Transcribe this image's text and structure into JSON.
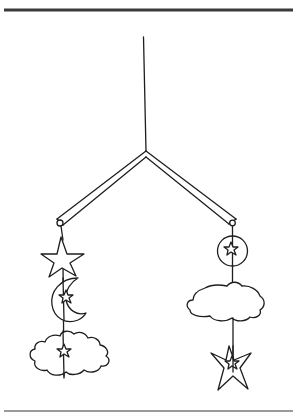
{
  "illustration": {
    "title": "Hanging mobile with stars, moon and clouds",
    "ink_color": "#1e1e1e",
    "background": "#ffffff",
    "rules": {
      "top": {
        "y": 10,
        "x1": 4,
        "x2": 293,
        "color": "#3a3a3a"
      },
      "bottom": {
        "y": 411,
        "x1": 4,
        "x2": 293,
        "color": "#9a9a9a"
      }
    },
    "hanger": {
      "string": {
        "x1": 143,
        "y1": 37,
        "x2": 146,
        "y2": 150
      },
      "junction": {
        "x": 146,
        "y": 152
      }
    },
    "left_arm": {
      "label": "left-arm",
      "end": {
        "x": 61,
        "y": 222
      },
      "hangs": [
        "star",
        "crescent-moon-with-star",
        "cloud-with-star"
      ]
    },
    "right_arm": {
      "label": "right-arm",
      "end": {
        "x": 232,
        "y": 224
      },
      "hangs": [
        "circle-with-star",
        "cloud",
        "star-with-inner-star"
      ]
    }
  }
}
